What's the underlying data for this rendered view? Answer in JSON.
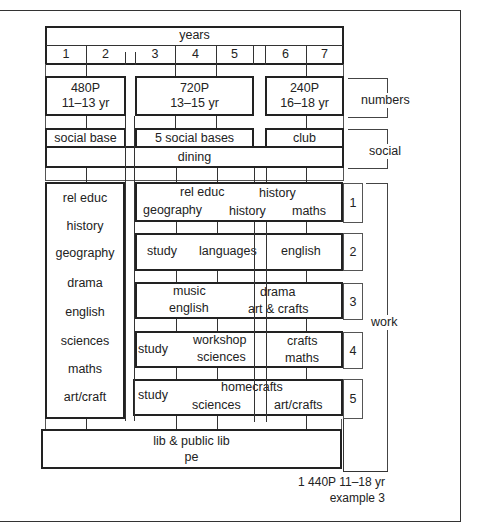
{
  "header": {
    "years_label": "years",
    "year_columns": [
      "1",
      "2",
      "3",
      "4",
      "5",
      "6",
      "7"
    ]
  },
  "numbers_row": {
    "blocks": [
      {
        "count": "480P",
        "ages": "11–13 yr"
      },
      {
        "count": "720P",
        "ages": "13–15 yr"
      },
      {
        "count": "240P",
        "ages": "16–18 yr"
      }
    ]
  },
  "social_row": {
    "blocks": [
      "social base",
      "5 social bases",
      "club"
    ],
    "dining": "dining"
  },
  "left_column": {
    "subjects": [
      "rel educ",
      "history",
      "geography",
      "drama",
      "english",
      "sciences",
      "maths",
      "art/craft"
    ]
  },
  "work_blocks": [
    {
      "number": "1",
      "line1": [
        "rel educ",
        "history"
      ],
      "line2": [
        "geography",
        "history",
        "maths"
      ]
    },
    {
      "number": "2",
      "line1": [
        "study",
        "languages",
        "english"
      ]
    },
    {
      "number": "3",
      "line1": [
        "music",
        "drama"
      ],
      "line2": [
        "english",
        "art & crafts"
      ]
    },
    {
      "number": "4",
      "left": "study",
      "line1": [
        "workshop",
        "crafts"
      ],
      "line2": [
        "sciences",
        "maths"
      ]
    },
    {
      "number": "5",
      "left": "study",
      "line1": [
        "homecrafts"
      ],
      "line2": [
        "sciences",
        "art/crafts"
      ]
    }
  ],
  "shared_block": {
    "line1": "lib & public lib",
    "line2": "pe"
  },
  "brackets": {
    "numbers": "numbers",
    "social": "social",
    "work": "work"
  },
  "caption": {
    "line1": "1 440P 11–18 yr",
    "line2": "example 3"
  }
}
